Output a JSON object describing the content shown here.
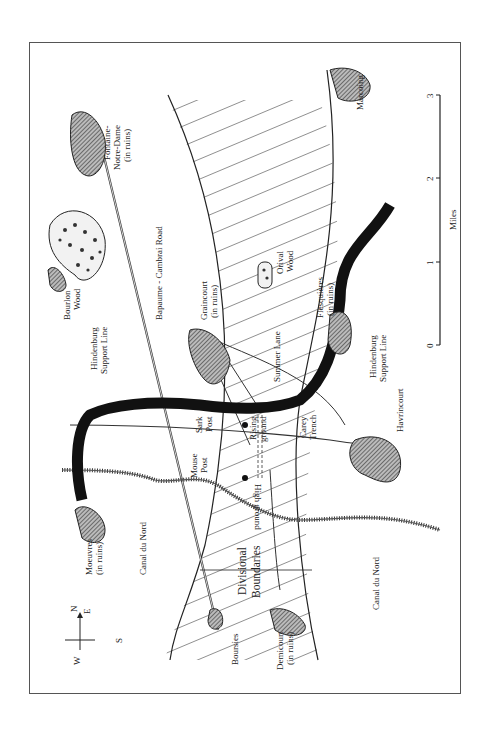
{
  "map": {
    "title": "Cambrai area map (rotated)",
    "orientation": "rotated 90 degrees; North points left",
    "compass": {
      "n": "N",
      "e": "E",
      "s": "S",
      "w": "W"
    },
    "labels": {
      "fontaine_1": "Fontaine-",
      "fontaine_2": "Notre-Dame",
      "fontaine_3": "(in ruins)",
      "bourlon_1": "Bourlon",
      "bourlon_2": "Wood",
      "road": "Bapaume - Cambrai Road",
      "hsl_top_1": "Hindenburg",
      "hsl_top_2": "Support Line",
      "graincourt_1": "Graincourt",
      "graincourt_2": "(in ruins)",
      "orival_1": "Orival",
      "orival_2": "Wood",
      "flesquieres_1": "Flesquières",
      "flesquieres_2": "(in ruins)",
      "summer_lane": "Summer Lane",
      "hsl_bot_1": "Hindenburg",
      "hsl_bot_2": "Support Line",
      "havrincourt": "Havrincourt",
      "marcoing": "Marcoing",
      "sark_1": "Sark",
      "sark_2": "Post",
      "mouse_1": "Mouse",
      "mouse_2": "Post",
      "rising_1": "Rising",
      "rising_2": "ground",
      "carey_1": "Carey",
      "carey_2": "Trench",
      "high_ground": "High ground",
      "moeuvres_1": "Moeuvres",
      "moeuvres_2": "(in ruins)",
      "canal_top": "Canal du Nord",
      "canal_bot": "Canal du Nord",
      "div_1": "Divisional",
      "div_2": "Boundaries",
      "boursies": "Boursies",
      "demicourt_1": "Demicourt",
      "demicourt_2": "(in ruins)"
    },
    "scale": {
      "ticks": [
        "0",
        "1",
        "2",
        "3"
      ],
      "unit": "Miles"
    }
  }
}
